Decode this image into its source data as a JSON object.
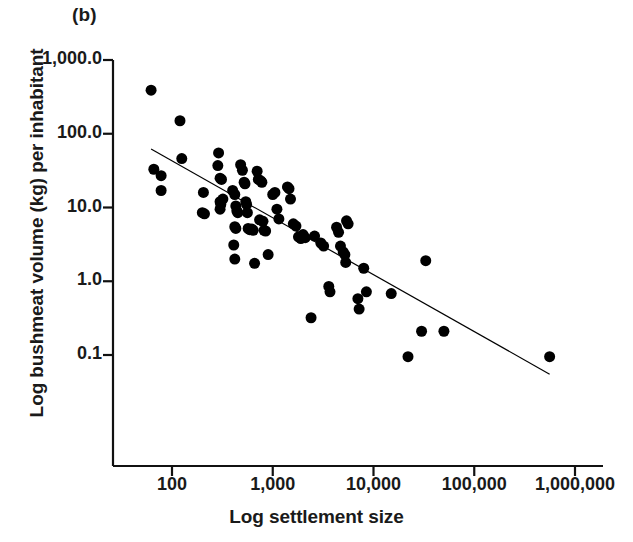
{
  "panel": {
    "label": "(b)"
  },
  "chart_data": {
    "type": "scatter",
    "title": "(b)",
    "xlabel": "Log settlement size",
    "ylabel": "Log bushmeat volume (kg) per inhabitant",
    "xscale": "log",
    "yscale": "log",
    "xlim": [
      50,
      1200000
    ],
    "ylim": [
      0.05,
      1000
    ],
    "xticks": [
      100,
      1000,
      10000,
      100000,
      1000000
    ],
    "xtick_labels": [
      "100",
      "1,000",
      "10,000",
      "100,000",
      "1,000,000"
    ],
    "yticks": [
      1000,
      100,
      10,
      1,
      0.1
    ],
    "ytick_labels": [
      "1,000.0",
      "100.0",
      "10.0",
      "1.0",
      "0.1"
    ],
    "grid": false,
    "legend": null,
    "marker": {
      "shape": "circle",
      "color": "#000000",
      "size_px": 11
    },
    "trendline": {
      "type": "linear-on-log-log",
      "color": "#000000",
      "width_px": 1.2,
      "x_start": 62,
      "y_start": 62,
      "x_end": 560000,
      "y_end": 0.055
    },
    "points": [
      {
        "x": 62,
        "y": 390
      },
      {
        "x": 120,
        "y": 150
      },
      {
        "x": 66,
        "y": 33
      },
      {
        "x": 78,
        "y": 27
      },
      {
        "x": 78,
        "y": 17
      },
      {
        "x": 125,
        "y": 46
      },
      {
        "x": 205,
        "y": 16
      },
      {
        "x": 200,
        "y": 8.5
      },
      {
        "x": 210,
        "y": 8.2
      },
      {
        "x": 290,
        "y": 55
      },
      {
        "x": 285,
        "y": 37
      },
      {
        "x": 300,
        "y": 25
      },
      {
        "x": 310,
        "y": 24
      },
      {
        "x": 300,
        "y": 12
      },
      {
        "x": 305,
        "y": 11
      },
      {
        "x": 300,
        "y": 9.5
      },
      {
        "x": 320,
        "y": 13
      },
      {
        "x": 400,
        "y": 17
      },
      {
        "x": 420,
        "y": 15
      },
      {
        "x": 430,
        "y": 10.5
      },
      {
        "x": 440,
        "y": 9.0
      },
      {
        "x": 450,
        "y": 8.5
      },
      {
        "x": 420,
        "y": 5.5
      },
      {
        "x": 430,
        "y": 5.2
      },
      {
        "x": 410,
        "y": 3.1
      },
      {
        "x": 420,
        "y": 2.0
      },
      {
        "x": 480,
        "y": 38
      },
      {
        "x": 500,
        "y": 32
      },
      {
        "x": 520,
        "y": 22
      },
      {
        "x": 530,
        "y": 21
      },
      {
        "x": 540,
        "y": 12
      },
      {
        "x": 550,
        "y": 11
      },
      {
        "x": 560,
        "y": 8.5
      },
      {
        "x": 570,
        "y": 5.2
      },
      {
        "x": 590,
        "y": 5.0
      },
      {
        "x": 620,
        "y": 5.1
      },
      {
        "x": 640,
        "y": 4.9
      },
      {
        "x": 660,
        "y": 1.75
      },
      {
        "x": 700,
        "y": 31
      },
      {
        "x": 720,
        "y": 24
      },
      {
        "x": 760,
        "y": 23
      },
      {
        "x": 780,
        "y": 22
      },
      {
        "x": 740,
        "y": 6.8
      },
      {
        "x": 800,
        "y": 6.5
      },
      {
        "x": 820,
        "y": 4.9
      },
      {
        "x": 850,
        "y": 4.8
      },
      {
        "x": 900,
        "y": 2.3
      },
      {
        "x": 1000,
        "y": 15
      },
      {
        "x": 1050,
        "y": 16
      },
      {
        "x": 1100,
        "y": 9.5
      },
      {
        "x": 1150,
        "y": 7.0
      },
      {
        "x": 1400,
        "y": 19
      },
      {
        "x": 1450,
        "y": 18
      },
      {
        "x": 1500,
        "y": 13
      },
      {
        "x": 1600,
        "y": 6.0
      },
      {
        "x": 1700,
        "y": 5.6
      },
      {
        "x": 1800,
        "y": 4.0
      },
      {
        "x": 1900,
        "y": 3.8
      },
      {
        "x": 2000,
        "y": 4.3
      },
      {
        "x": 2100,
        "y": 3.9
      },
      {
        "x": 2400,
        "y": 0.32
      },
      {
        "x": 2600,
        "y": 4.1
      },
      {
        "x": 3000,
        "y": 3.3
      },
      {
        "x": 3200,
        "y": 3.0
      },
      {
        "x": 3600,
        "y": 0.85
      },
      {
        "x": 3700,
        "y": 0.72
      },
      {
        "x": 4300,
        "y": 5.4
      },
      {
        "x": 4500,
        "y": 4.6
      },
      {
        "x": 4700,
        "y": 3.0
      },
      {
        "x": 5000,
        "y": 2.5
      },
      {
        "x": 5200,
        "y": 2.3
      },
      {
        "x": 5300,
        "y": 1.8
      },
      {
        "x": 5400,
        "y": 6.6
      },
      {
        "x": 5600,
        "y": 6.0
      },
      {
        "x": 7000,
        "y": 0.58
      },
      {
        "x": 7200,
        "y": 0.42
      },
      {
        "x": 8000,
        "y": 1.5
      },
      {
        "x": 8500,
        "y": 0.72
      },
      {
        "x": 15000,
        "y": 0.68
      },
      {
        "x": 22000,
        "y": 0.095
      },
      {
        "x": 30000,
        "y": 0.21
      },
      {
        "x": 33000,
        "y": 1.9
      },
      {
        "x": 50000,
        "y": 0.21
      },
      {
        "x": 560000,
        "y": 0.095
      }
    ]
  }
}
